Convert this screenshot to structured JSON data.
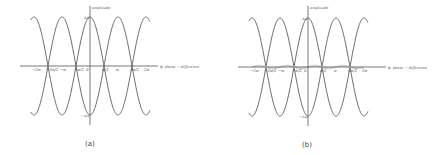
{
  "panels": [
    {
      "id": "a",
      "caption": "(a)",
      "y_axis_label": "amplitude",
      "x_axis_label": "ϕ, phase − difference",
      "y_max_label": "ΔA",
      "y_min_label": "−ΔA",
      "x_ticks": [
        "−2π",
        "−3π/2",
        "−π",
        "−π/2",
        "0",
        "π/2",
        "π",
        "3π/2",
        "2π"
      ],
      "has_shaded_residual": false
    },
    {
      "id": "b",
      "caption": "(b)",
      "y_axis_label": "amplitude",
      "x_axis_label": "ϕ, phase − difference",
      "y_max_label": "ΔA",
      "y_min_label": "−ΔA",
      "x_ticks": [
        "−2π",
        "−3π/2",
        "−π",
        "−π/2",
        "0",
        "π/2",
        "π",
        "3π/2",
        "2π"
      ],
      "has_shaded_residual": true
    }
  ],
  "colors": {
    "curve": "#6a6a6a",
    "axis": "#555555",
    "shade": "#cfcfcf"
  }
}
